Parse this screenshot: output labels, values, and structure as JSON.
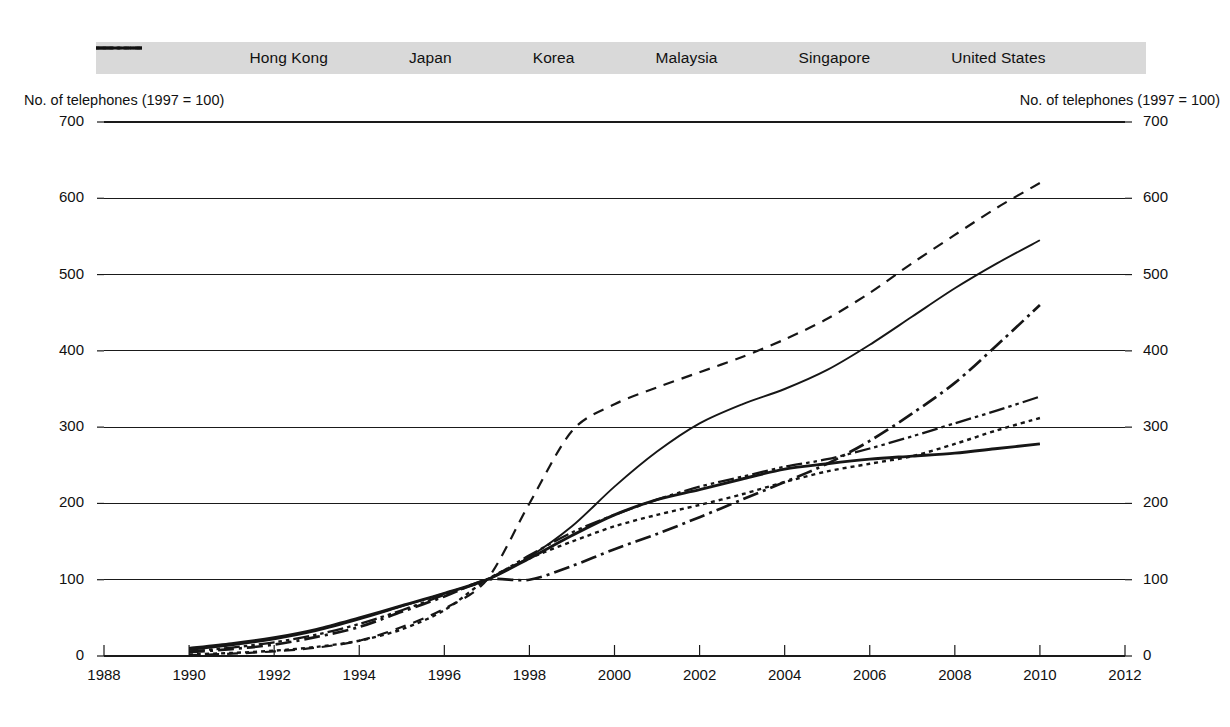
{
  "legend": {
    "position": "top",
    "background": "#d9d9d9",
    "items": [
      {
        "label": "Hong Kong",
        "style": "solid",
        "icon": "line-solid-icon"
      },
      {
        "label": "Japan",
        "style": "dotted",
        "icon": "line-dotted-icon"
      },
      {
        "label": "Korea",
        "style": "dashed",
        "icon": "line-dashed-icon"
      },
      {
        "label": "Malaysia",
        "style": "dash-dot",
        "icon": "line-dash-dot-icon"
      },
      {
        "label": "Singapore",
        "style": "dash-dot-dot",
        "icon": "line-dash-dot-dot-icon"
      },
      {
        "label": "United States",
        "style": "solid-thick",
        "icon": "line-solid-thick-icon"
      }
    ]
  },
  "axes": {
    "left_caption": "No. of telephones (1997 = 100)",
    "right_caption": "No. of telephones (1997 = 100)",
    "y_ticks": [
      "0",
      "100",
      "200",
      "300",
      "400",
      "500",
      "600",
      "700"
    ],
    "x_ticks": [
      "1988",
      "1990",
      "1992",
      "1994",
      "1996",
      "1998",
      "2000",
      "2002",
      "2004",
      "2006",
      "2008",
      "2010",
      "2012"
    ]
  },
  "chart_data": {
    "type": "line",
    "title": "",
    "subtitle": "",
    "xlabel": "",
    "ylabel": "No. of telephones (1997 = 100)",
    "xlim": [
      1988,
      2012
    ],
    "ylim": [
      0,
      700
    ],
    "grid": true,
    "legend_position": "top",
    "x": [
      1990,
      1991,
      1992,
      1993,
      1994,
      1995,
      1996,
      1997,
      1998,
      1999,
      2000,
      2001,
      2002,
      2003,
      2004,
      2005,
      2006,
      2007,
      2008,
      2009,
      2010
    ],
    "series": [
      {
        "name": "Hong Kong",
        "style": "solid",
        "values": [
          8,
          14,
          22,
          33,
          48,
          65,
          82,
          100,
          130,
          170,
          222,
          268,
          305,
          330,
          350,
          375,
          408,
          445,
          482,
          515,
          545
        ]
      },
      {
        "name": "Japan",
        "style": "dotted",
        "values": [
          2,
          4,
          7,
          12,
          20,
          35,
          60,
          100,
          128,
          150,
          170,
          185,
          198,
          212,
          228,
          242,
          252,
          262,
          278,
          296,
          312
        ]
      },
      {
        "name": "Korea",
        "style": "dashed",
        "values": [
          1,
          3,
          6,
          11,
          20,
          38,
          62,
          100,
          200,
          295,
          330,
          352,
          372,
          392,
          415,
          442,
          476,
          515,
          552,
          588,
          620
        ]
      },
      {
        "name": "Malaysia",
        "style": "dash-dot",
        "values": [
          5,
          9,
          15,
          25,
          38,
          58,
          78,
          100,
          100,
          118,
          140,
          160,
          182,
          205,
          228,
          252,
          282,
          318,
          358,
          408,
          460
        ]
      },
      {
        "name": "Singapore",
        "style": "dash-dot-dot",
        "values": [
          6,
          11,
          18,
          28,
          42,
          60,
          80,
          100,
          132,
          162,
          185,
          205,
          222,
          235,
          248,
          258,
          272,
          288,
          305,
          322,
          340
        ]
      },
      {
        "name": "United States",
        "style": "solid-thick",
        "values": [
          10,
          16,
          24,
          35,
          50,
          66,
          82,
          100,
          128,
          158,
          185,
          205,
          218,
          232,
          245,
          252,
          258,
          262,
          266,
          272,
          278
        ]
      }
    ]
  }
}
